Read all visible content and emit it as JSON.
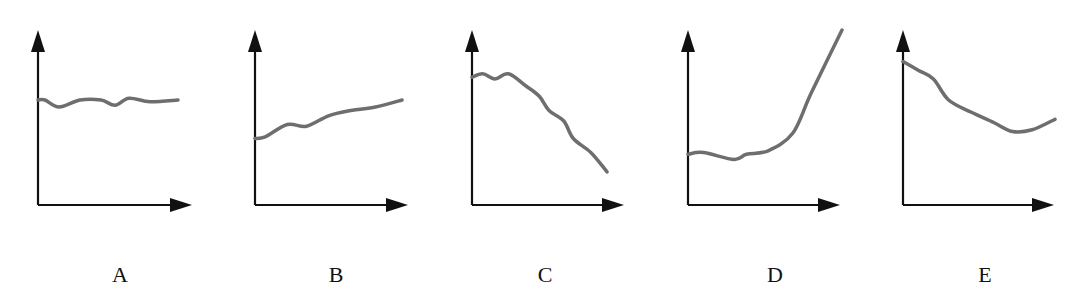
{
  "figure": {
    "curve_color": "#6e6e6e",
    "axis_color": "#111111"
  },
  "chart_data": [
    {
      "type": "line",
      "label": "A",
      "description": "roughly constant, slightly wavy",
      "title": "",
      "xlabel": "",
      "ylabel": "",
      "x": [
        0,
        0.05,
        0.15,
        0.3,
        0.45,
        0.55,
        0.65,
        0.8,
        1.0
      ],
      "y": [
        0.6,
        0.6,
        0.56,
        0.6,
        0.6,
        0.57,
        0.61,
        0.59,
        0.6
      ],
      "xlim": [
        0,
        1.1
      ],
      "ylim": [
        0,
        1
      ]
    },
    {
      "type": "line",
      "label": "B",
      "description": "slowly increasing",
      "title": "",
      "xlabel": "",
      "ylabel": "",
      "x": [
        0,
        0.07,
        0.22,
        0.35,
        0.5,
        0.65,
        0.82,
        1.0
      ],
      "y": [
        0.38,
        0.39,
        0.46,
        0.45,
        0.51,
        0.54,
        0.56,
        0.6
      ],
      "xlim": [
        0,
        1.1
      ],
      "ylim": [
        0,
        1
      ]
    },
    {
      "type": "line",
      "label": "C",
      "description": "decreasing after initial plateau",
      "title": "",
      "xlabel": "",
      "ylabel": "",
      "x": [
        0,
        0.08,
        0.17,
        0.27,
        0.4,
        0.5,
        0.57,
        0.68,
        0.75,
        0.88,
        1.0
      ],
      "y": [
        0.73,
        0.75,
        0.72,
        0.75,
        0.68,
        0.62,
        0.54,
        0.48,
        0.38,
        0.3,
        0.19
      ],
      "xlim": [
        0,
        1.1
      ],
      "ylim": [
        0,
        1
      ]
    },
    {
      "type": "line",
      "label": "D",
      "description": "flat then sharply increasing",
      "title": "",
      "xlabel": "",
      "ylabel": "",
      "x": [
        0,
        0.1,
        0.3,
        0.38,
        0.52,
        0.68,
        0.8,
        1.0
      ],
      "y": [
        0.29,
        0.3,
        0.26,
        0.29,
        0.31,
        0.41,
        0.64,
        1.0
      ],
      "xlim": [
        0,
        1.1
      ],
      "ylim": [
        0,
        1
      ]
    },
    {
      "type": "line",
      "label": "E",
      "description": "decreasing then slight rise",
      "title": "",
      "xlabel": "",
      "ylabel": "",
      "x": [
        0,
        0.1,
        0.2,
        0.3,
        0.45,
        0.6,
        0.72,
        0.85,
        1.0
      ],
      "y": [
        0.82,
        0.77,
        0.72,
        0.6,
        0.53,
        0.47,
        0.42,
        0.43,
        0.49
      ],
      "xlim": [
        0,
        1.1
      ],
      "ylim": [
        0,
        1
      ]
    }
  ]
}
